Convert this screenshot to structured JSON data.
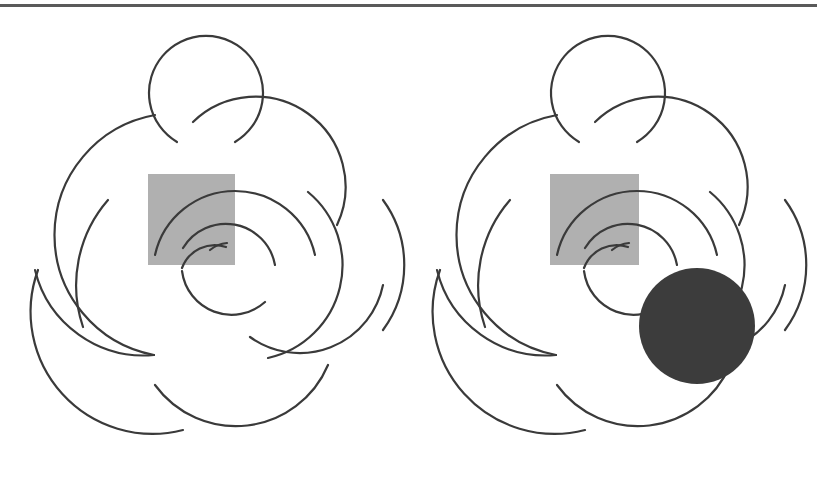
{
  "colors": {
    "background": "#ffffff",
    "stroke": "#3a3a3a",
    "top_rule": "#5a5a5a",
    "square_fill": "#b0b0b0",
    "disk_fill": "#3c3c3c"
  },
  "top_rule": {
    "y": 5,
    "thickness": 3
  },
  "figures": [
    {
      "name": "left-figure",
      "offset_x": 0,
      "square": {
        "x": 148,
        "y": 174,
        "w": 87,
        "h": 91
      },
      "disk": null
    },
    {
      "name": "right-figure",
      "offset_x": 402,
      "square": {
        "x": 148,
        "y": 174,
        "w": 89,
        "h": 91
      },
      "disk": {
        "cx": 697,
        "cy": 326,
        "r": 58
      }
    }
  ],
  "arcs": [
    "M 177 142 A 57 57 0 1 1 235 142",
    "M 193 122 A 90 90 0 0 1 337 225",
    "M 155 115 A 122 122 0 0 0 154 355",
    "M 108 200 A 130 130 0 0 0 83 327",
    "M 38 270 A 122 122 0 0 0 183 430",
    "M 155 385 A 100 100 0 0 0 328 365",
    "M 308 192 A 95 95 0 0 1 268 358",
    "M 155 255 A 82 82 0 0 1 315 255",
    "M 35 270 A 112 112 0 0 0 154 355",
    "M 250 337 A 85 85 0 0 0 383 285",
    "M 383 330 A 110 110 0 0 0 383 200",
    "M 183 248 A 50 50 0 0 1 275 265",
    "M 210 250 A 30 30 0 0 1 227 243",
    "M 182 268 A 35 35 0 0 1 226 247",
    "M 182 271 A 50 50 0 0 0 265 302"
  ]
}
